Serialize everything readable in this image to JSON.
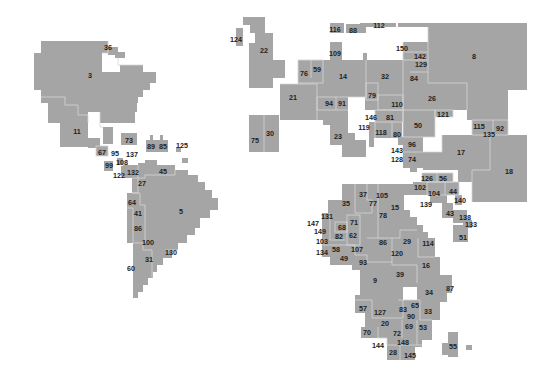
{
  "map": {
    "kind": "cartogram",
    "colors": {
      "land": "#a5a5a5",
      "border": "#d6d6d6",
      "label": "#222222",
      "background": "#ffffff"
    },
    "continents": [
      {
        "name": "north-america",
        "regions": [
          {
            "label": "36",
            "x": 108,
            "y": 47
          },
          {
            "label": "3",
            "x": 90,
            "y": 75
          },
          {
            "label": "11",
            "x": 77,
            "y": 131
          },
          {
            "label": "73",
            "x": 129,
            "y": 140
          },
          {
            "label": "89",
            "x": 151,
            "y": 146
          },
          {
            "label": "85",
            "x": 163,
            "y": 146
          },
          {
            "label": "125",
            "x": 182,
            "y": 145
          },
          {
            "label": "67",
            "x": 102,
            "y": 152
          },
          {
            "label": "95",
            "x": 115,
            "y": 153
          },
          {
            "label": "137",
            "x": 132,
            "y": 154
          },
          {
            "label": "99",
            "x": 109,
            "y": 165
          },
          {
            "label": "108",
            "x": 122,
            "y": 162
          },
          {
            "label": "122",
            "x": 119,
            "y": 175
          },
          {
            "label": "132",
            "x": 133,
            "y": 172
          },
          {
            "label": "45",
            "x": 163,
            "y": 171
          },
          {
            "label": "27",
            "x": 142,
            "y": 183
          }
        ]
      },
      {
        "name": "south-america",
        "regions": [
          {
            "label": "64",
            "x": 132,
            "y": 202
          },
          {
            "label": "41",
            "x": 138,
            "y": 213
          },
          {
            "label": "5",
            "x": 181,
            "y": 211
          },
          {
            "label": "86",
            "x": 138,
            "y": 228
          },
          {
            "label": "100",
            "x": 148,
            "y": 242
          },
          {
            "label": "130",
            "x": 171,
            "y": 252
          },
          {
            "label": "31",
            "x": 149,
            "y": 259
          },
          {
            "label": "60",
            "x": 131,
            "y": 268
          }
        ]
      },
      {
        "name": "europe-asia",
        "regions": [
          {
            "label": "124",
            "x": 236,
            "y": 39
          },
          {
            "label": "22",
            "x": 264,
            "y": 50
          },
          {
            "label": "116",
            "x": 335,
            "y": 29
          },
          {
            "label": "88",
            "x": 353,
            "y": 30
          },
          {
            "label": "112",
            "x": 379,
            "y": 25
          },
          {
            "label": "109",
            "x": 335,
            "y": 53
          },
          {
            "label": "150",
            "x": 402,
            "y": 48
          },
          {
            "label": "142",
            "x": 420,
            "y": 56
          },
          {
            "label": "129",
            "x": 421,
            "y": 64
          },
          {
            "label": "84",
            "x": 414,
            "y": 78
          },
          {
            "label": "8",
            "x": 474,
            "y": 56
          },
          {
            "label": "76",
            "x": 304,
            "y": 73
          },
          {
            "label": "59",
            "x": 317,
            "y": 69
          },
          {
            "label": "14",
            "x": 343,
            "y": 76
          },
          {
            "label": "32",
            "x": 385,
            "y": 76
          },
          {
            "label": "21",
            "x": 293,
            "y": 97
          },
          {
            "label": "94",
            "x": 329,
            "y": 103
          },
          {
            "label": "91",
            "x": 342,
            "y": 103
          },
          {
            "label": "79",
            "x": 372,
            "y": 95
          },
          {
            "label": "110",
            "x": 397,
            "y": 104
          },
          {
            "label": "26",
            "x": 432,
            "y": 98
          },
          {
            "label": "121",
            "x": 443,
            "y": 114
          },
          {
            "label": "146",
            "x": 371,
            "y": 117
          },
          {
            "label": "81",
            "x": 390,
            "y": 117
          },
          {
            "label": "50",
            "x": 418,
            "y": 125
          },
          {
            "label": "115",
            "x": 479,
            "y": 126
          },
          {
            "label": "92",
            "x": 500,
            "y": 128
          },
          {
            "label": "135",
            "x": 489,
            "y": 134
          },
          {
            "label": "119",
            "x": 364,
            "y": 127
          },
          {
            "label": "118",
            "x": 381,
            "y": 132
          },
          {
            "label": "80",
            "x": 397,
            "y": 134
          },
          {
            "label": "23",
            "x": 338,
            "y": 136
          },
          {
            "label": "30",
            "x": 270,
            "y": 133
          },
          {
            "label": "75",
            "x": 255,
            "y": 140
          },
          {
            "label": "96",
            "x": 412,
            "y": 144
          },
          {
            "label": "143",
            "x": 397,
            "y": 150
          },
          {
            "label": "17",
            "x": 461,
            "y": 152
          },
          {
            "label": "128",
            "x": 397,
            "y": 159
          },
          {
            "label": "74",
            "x": 412,
            "y": 159
          },
          {
            "label": "18",
            "x": 509,
            "y": 171
          }
        ]
      },
      {
        "name": "africa",
        "regions": [
          {
            "label": "126",
            "x": 427,
            "y": 178
          },
          {
            "label": "56",
            "x": 443,
            "y": 178
          },
          {
            "label": "102",
            "x": 420,
            "y": 187
          },
          {
            "label": "104",
            "x": 434,
            "y": 193
          },
          {
            "label": "44",
            "x": 453,
            "y": 191
          },
          {
            "label": "37",
            "x": 363,
            "y": 194
          },
          {
            "label": "105",
            "x": 382,
            "y": 195
          },
          {
            "label": "35",
            "x": 346,
            "y": 203
          },
          {
            "label": "77",
            "x": 373,
            "y": 203
          },
          {
            "label": "15",
            "x": 395,
            "y": 207
          },
          {
            "label": "140",
            "x": 460,
            "y": 200
          },
          {
            "label": "139",
            "x": 426,
            "y": 204
          },
          {
            "label": "78",
            "x": 383,
            "y": 215
          },
          {
            "label": "131",
            "x": 327,
            "y": 216
          },
          {
            "label": "71",
            "x": 354,
            "y": 222
          },
          {
            "label": "43",
            "x": 450,
            "y": 213
          },
          {
            "label": "138",
            "x": 465,
            "y": 217
          },
          {
            "label": "147",
            "x": 313,
            "y": 223
          },
          {
            "label": "68",
            "x": 342,
            "y": 227
          },
          {
            "label": "133",
            "x": 471,
            "y": 224
          },
          {
            "label": "149",
            "x": 320,
            "y": 231
          },
          {
            "label": "82",
            "x": 339,
            "y": 236
          },
          {
            "label": "62",
            "x": 353,
            "y": 235
          },
          {
            "label": "103",
            "x": 322,
            "y": 241
          },
          {
            "label": "86",
            "x": 383,
            "y": 242
          },
          {
            "label": "29",
            "x": 407,
            "y": 241
          },
          {
            "label": "114",
            "x": 428,
            "y": 243
          },
          {
            "label": "51",
            "x": 463,
            "y": 237
          },
          {
            "label": "120",
            "x": 397,
            "y": 253
          },
          {
            "label": "134",
            "x": 322,
            "y": 252
          },
          {
            "label": "58",
            "x": 336,
            "y": 249
          },
          {
            "label": "107",
            "x": 357,
            "y": 249
          },
          {
            "label": "49",
            "x": 344,
            "y": 258
          },
          {
            "label": "93",
            "x": 363,
            "y": 262
          },
          {
            "label": "16",
            "x": 426,
            "y": 265
          },
          {
            "label": "39",
            "x": 400,
            "y": 274
          },
          {
            "label": "9",
            "x": 375,
            "y": 280
          },
          {
            "label": "34",
            "x": 429,
            "y": 292
          },
          {
            "label": "87",
            "x": 450,
            "y": 288
          },
          {
            "label": "57",
            "x": 363,
            "y": 308
          },
          {
            "label": "83",
            "x": 403,
            "y": 309
          },
          {
            "label": "65",
            "x": 415,
            "y": 305
          },
          {
            "label": "33",
            "x": 428,
            "y": 311
          },
          {
            "label": "127",
            "x": 380,
            "y": 312
          },
          {
            "label": "90",
            "x": 411,
            "y": 316
          },
          {
            "label": "20",
            "x": 385,
            "y": 323
          },
          {
            "label": "69",
            "x": 409,
            "y": 326
          },
          {
            "label": "53",
            "x": 423,
            "y": 327
          },
          {
            "label": "70",
            "x": 367,
            "y": 332
          },
          {
            "label": "72",
            "x": 397,
            "y": 333
          },
          {
            "label": "148",
            "x": 403,
            "y": 342
          },
          {
            "label": "144",
            "x": 378,
            "y": 345
          },
          {
            "label": "28",
            "x": 393,
            "y": 352
          },
          {
            "label": "145",
            "x": 410,
            "y": 355
          },
          {
            "label": "55",
            "x": 453,
            "y": 346
          }
        ]
      }
    ]
  }
}
